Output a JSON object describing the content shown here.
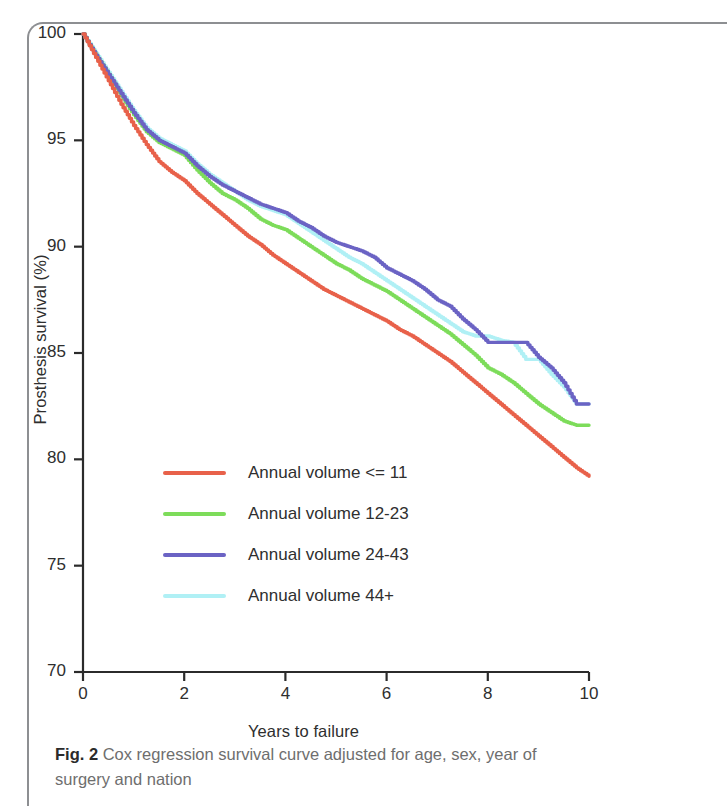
{
  "figure": {
    "caption_label": "Fig. 2",
    "caption_text": "Cox regression survival curve adjusted for age, sex, year of surgery and nation"
  },
  "chart_data": {
    "type": "line",
    "title": "",
    "subtitle": "",
    "xlabel": "Years to failure",
    "ylabel": "Prosthesis survival (%)",
    "xlim": [
      0,
      10
    ],
    "ylim": [
      70,
      100
    ],
    "xticks": [
      0,
      2,
      4,
      6,
      8,
      10
    ],
    "yticks": [
      70,
      75,
      80,
      85,
      90,
      95,
      100
    ],
    "xtick_labels": [
      "0",
      "2",
      "4",
      "6",
      "8",
      "10"
    ],
    "ytick_labels": [
      "70",
      "75",
      "80",
      "85",
      "90",
      "95",
      "100"
    ],
    "grid": false,
    "legend_position": "center-left",
    "step_style": "kaplan-meier-step",
    "series": [
      {
        "name": "Annual volume <= 11",
        "color": "#e8614a",
        "x": [
          0.0,
          0.25,
          0.5,
          0.75,
          1.0,
          1.25,
          1.5,
          1.75,
          2.0,
          2.25,
          2.5,
          2.75,
          3.0,
          3.25,
          3.5,
          3.75,
          4.0,
          4.25,
          4.5,
          4.75,
          5.0,
          5.25,
          5.5,
          5.75,
          6.0,
          6.25,
          6.5,
          6.75,
          7.0,
          7.25,
          7.5,
          7.75,
          8.0,
          8.25,
          8.5,
          8.75,
          9.0,
          9.25,
          9.5,
          9.75,
          10.0
        ],
        "values": [
          100.0,
          98.9,
          97.8,
          96.7,
          95.7,
          94.8,
          94.0,
          93.5,
          93.1,
          92.5,
          92.0,
          91.5,
          91.0,
          90.5,
          90.1,
          89.6,
          89.2,
          88.8,
          88.4,
          88.0,
          87.7,
          87.4,
          87.1,
          86.8,
          86.5,
          86.1,
          85.8,
          85.4,
          85.0,
          84.6,
          84.1,
          83.6,
          83.1,
          82.6,
          82.1,
          81.6,
          81.1,
          80.6,
          80.1,
          79.6,
          79.2
        ]
      },
      {
        "name": "Annual volume 12-23",
        "color": "#7ddc5a",
        "x": [
          0.0,
          0.25,
          0.5,
          0.75,
          1.0,
          1.25,
          1.5,
          1.75,
          2.0,
          2.25,
          2.5,
          2.75,
          3.0,
          3.25,
          3.5,
          3.75,
          4.0,
          4.25,
          4.5,
          4.75,
          5.0,
          5.25,
          5.5,
          5.75,
          6.0,
          6.25,
          6.5,
          6.75,
          7.0,
          7.25,
          7.5,
          7.75,
          8.0,
          8.25,
          8.5,
          8.75,
          9.0,
          9.25,
          9.5,
          9.75,
          10.0
        ],
        "values": [
          100.0,
          99.0,
          98.1,
          97.1,
          96.2,
          95.4,
          94.9,
          94.6,
          94.3,
          93.6,
          93.0,
          92.5,
          92.2,
          91.8,
          91.3,
          91.0,
          90.8,
          90.4,
          90.0,
          89.6,
          89.2,
          88.9,
          88.5,
          88.2,
          87.9,
          87.5,
          87.1,
          86.7,
          86.3,
          85.9,
          85.4,
          84.9,
          84.3,
          84.0,
          83.6,
          83.1,
          82.6,
          82.2,
          81.8,
          81.6,
          81.6
        ]
      },
      {
        "name": "Annual volume 24-43",
        "color": "#6b63c4",
        "x": [
          0.0,
          0.25,
          0.5,
          0.75,
          1.0,
          1.25,
          1.5,
          1.75,
          2.0,
          2.25,
          2.5,
          2.75,
          3.0,
          3.25,
          3.5,
          3.75,
          4.0,
          4.25,
          4.5,
          4.75,
          5.0,
          5.25,
          5.5,
          5.75,
          6.0,
          6.25,
          6.5,
          6.75,
          7.0,
          7.25,
          7.5,
          7.75,
          8.0,
          8.25,
          8.5,
          8.75,
          9.0,
          9.25,
          9.5,
          9.75,
          10.0
        ],
        "values": [
          100.0,
          99.0,
          98.1,
          97.2,
          96.3,
          95.5,
          95.0,
          94.7,
          94.4,
          93.8,
          93.3,
          92.9,
          92.6,
          92.3,
          92.0,
          91.8,
          91.6,
          91.2,
          90.9,
          90.5,
          90.2,
          90.0,
          89.8,
          89.5,
          89.0,
          88.7,
          88.4,
          88.0,
          87.5,
          87.2,
          86.6,
          86.1,
          85.5,
          85.5,
          85.5,
          85.5,
          84.8,
          84.3,
          83.6,
          82.6,
          82.6
        ]
      },
      {
        "name": "Annual volume 44+",
        "color": "#b0f0f5",
        "x": [
          0.0,
          0.25,
          0.5,
          0.75,
          1.0,
          1.25,
          1.5,
          1.75,
          2.0,
          2.25,
          2.5,
          2.75,
          3.0,
          3.25,
          3.5,
          3.75,
          4.0,
          4.25,
          4.5,
          4.75,
          5.0,
          5.25,
          5.5,
          5.75,
          6.0,
          6.25,
          6.5,
          6.75,
          7.0,
          7.25,
          7.5,
          7.75,
          8.0,
          8.25,
          8.5,
          8.75,
          9.0,
          9.25,
          9.5,
          9.75,
          10.0
        ],
        "values": [
          100.0,
          99.1,
          98.2,
          97.3,
          96.4,
          95.6,
          95.1,
          94.8,
          94.5,
          93.9,
          93.4,
          93.0,
          92.6,
          92.2,
          91.9,
          91.7,
          91.5,
          91.1,
          90.7,
          90.3,
          89.9,
          89.5,
          89.2,
          88.8,
          88.4,
          88.0,
          87.6,
          87.2,
          86.8,
          86.4,
          86.0,
          85.8,
          85.8,
          85.6,
          85.5,
          84.7,
          84.7,
          84.0,
          83.4,
          82.6,
          82.6
        ]
      }
    ]
  }
}
